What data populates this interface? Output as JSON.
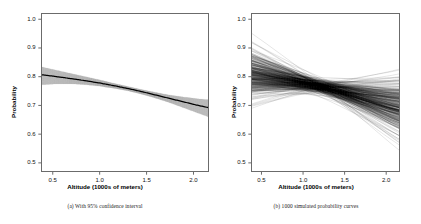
{
  "figure": {
    "panels": [
      {
        "id": "panel-a",
        "caption": "(a) With 95% confidence interval",
        "xlabel": "Altitude (1000s of meters)",
        "ylabel": "Probability"
      },
      {
        "id": "panel-b",
        "caption": "(b) 1000 simulated probability curves",
        "xlabel": "Altitude (1000s of meters)",
        "ylabel": "Probability"
      }
    ]
  },
  "chart_data": [
    {
      "type": "line",
      "title": "",
      "subtitle": "",
      "caption": "(a) With 95% confidence interval",
      "xlabel": "Altitude (1000s of meters)",
      "ylabel": "Probability",
      "xlim": [
        0.38,
        2.16
      ],
      "ylim": [
        0.47,
        1.02
      ],
      "xticks": [
        0.5,
        1.0,
        1.5,
        2.0
      ],
      "xticklabels": [
        "0.5",
        "1.0",
        "1.5",
        "2.0"
      ],
      "yticks": [
        0.5,
        0.6,
        0.7,
        0.8,
        0.9,
        1.0
      ],
      "yticklabels": [
        "0.5",
        "0.6",
        "0.7",
        "0.8",
        "0.9",
        "1.0"
      ],
      "grid": false,
      "legend": "none",
      "band_color": "#b4b4b4",
      "line_color": "#000000",
      "x": [
        0.4,
        0.55,
        0.7,
        0.85,
        1.0,
        1.15,
        1.3,
        1.45,
        1.6,
        1.75,
        1.9,
        2.05,
        2.15
      ],
      "series": [
        {
          "name": "fitted probability",
          "values": [
            0.806,
            0.8,
            0.793,
            0.786,
            0.778,
            0.769,
            0.759,
            0.748,
            0.736,
            0.724,
            0.712,
            0.7,
            0.693
          ]
        },
        {
          "name": "95% CI upper",
          "values": [
            0.833,
            0.822,
            0.811,
            0.8,
            0.789,
            0.777,
            0.766,
            0.755,
            0.745,
            0.736,
            0.729,
            0.723,
            0.72
          ]
        },
        {
          "name": "95% CI lower",
          "values": [
            0.772,
            0.775,
            0.775,
            0.772,
            0.767,
            0.76,
            0.751,
            0.739,
            0.725,
            0.709,
            0.691,
            0.673,
            0.661
          ]
        }
      ]
    },
    {
      "type": "line",
      "title": "",
      "subtitle": "",
      "caption": "(b) 1000 simulated probability curves",
      "xlabel": "Altitude (1000s of meters)",
      "ylabel": "Probability",
      "xlim": [
        0.38,
        2.16
      ],
      "ylim": [
        0.47,
        1.02
      ],
      "xticks": [
        0.5,
        1.0,
        1.5,
        2.0
      ],
      "xticklabels": [
        "0.5",
        "1.0",
        "1.5",
        "2.0"
      ],
      "yticks": [
        0.5,
        0.6,
        0.7,
        0.8,
        0.9,
        1.0
      ],
      "yticklabels": [
        "0.5",
        "0.6",
        "0.7",
        "0.8",
        "0.9",
        "1.0"
      ],
      "grid": false,
      "legend": "none",
      "n_simulations": 1000,
      "line_color": "#000000",
      "x": [
        0.4,
        0.55,
        0.7,
        0.85,
        1.0,
        1.15,
        1.3,
        1.45,
        1.6,
        1.75,
        1.9,
        2.05,
        2.15
      ],
      "series": [
        {
          "name": "mean simulated curve",
          "values": [
            0.806,
            0.8,
            0.793,
            0.786,
            0.778,
            0.769,
            0.759,
            0.748,
            0.736,
            0.724,
            0.712,
            0.7,
            0.693
          ]
        },
        {
          "name": "simulation envelope upper",
          "values": [
            0.836,
            0.824,
            0.813,
            0.801,
            0.79,
            0.778,
            0.767,
            0.757,
            0.747,
            0.739,
            0.732,
            0.727,
            0.724
          ]
        },
        {
          "name": "simulation envelope lower",
          "values": [
            0.77,
            0.773,
            0.773,
            0.771,
            0.766,
            0.759,
            0.749,
            0.737,
            0.722,
            0.705,
            0.687,
            0.668,
            0.656
          ]
        }
      ]
    }
  ]
}
